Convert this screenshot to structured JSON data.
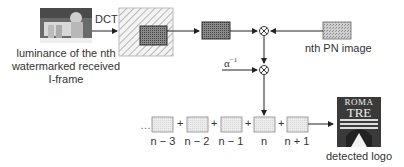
{
  "diagram": {
    "input": {
      "caption_lines": [
        "luminance of the nth",
        "watermarked received",
        "I-frame"
      ]
    },
    "transform_label": "DCT",
    "pn": {
      "caption": "nth PN image"
    },
    "scale": {
      "label": "α",
      "exponent": "−1"
    },
    "sequence": {
      "prefix": "…",
      "operator": "+",
      "frames": [
        {
          "label": "n − 3"
        },
        {
          "label": "n − 2"
        },
        {
          "label": "n − 1"
        },
        {
          "label": "n"
        },
        {
          "label": "n + 1"
        }
      ]
    },
    "output": {
      "logo_top": "ROMA",
      "logo_bottom": "TRE",
      "caption": "detected logo"
    },
    "colors": {
      "line": "#222222",
      "hatch": "#bbbbbb",
      "dark_box": "#777777",
      "light_box": "#e6e6e6",
      "logo_bg": "#333333"
    }
  }
}
